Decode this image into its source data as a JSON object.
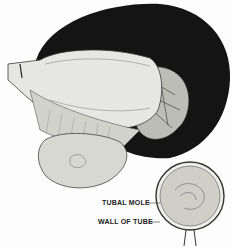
{
  "figure": {
    "labels": {
      "tubal_mole": "TUBAL MOLE",
      "wall_of_tube": "WALL OF TUBE"
    },
    "colors": {
      "background_dark": "#141414",
      "tissue_light": "#e6e6e2",
      "line": "#3a3a3a"
    }
  }
}
